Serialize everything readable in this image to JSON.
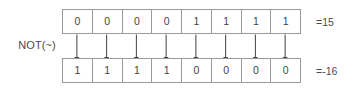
{
  "diagram": {
    "type": "bitwise-not-operation",
    "operation_label": "NOT(~)",
    "input": {
      "bits": [
        "0",
        "0",
        "0",
        "0",
        "1",
        "1",
        "1",
        "1"
      ],
      "value_label": "=15"
    },
    "output": {
      "bits": [
        "1",
        "1",
        "1",
        "1",
        "0",
        "0",
        "0",
        "0"
      ],
      "value_label": "=-16"
    },
    "arrow_count": 8,
    "colors": {
      "background": "#ffffff",
      "cell_border": "#9a9a9a",
      "text": "#4a4a4a",
      "arrow": "#404040"
    }
  }
}
